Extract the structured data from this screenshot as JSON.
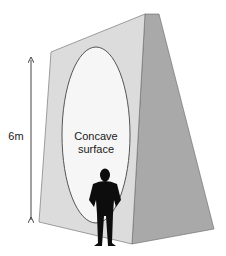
{
  "diagram": {
    "height_label": "6m",
    "surface_label_line1": "Concave",
    "surface_label_line2": "surface",
    "colors": {
      "front_face": "#dcdcdc",
      "side_face": "#a9a9a9",
      "concave_area": "#f6f6f6",
      "outline": "#555555",
      "person": "#0d0d0d",
      "arrow": "#444444"
    }
  }
}
